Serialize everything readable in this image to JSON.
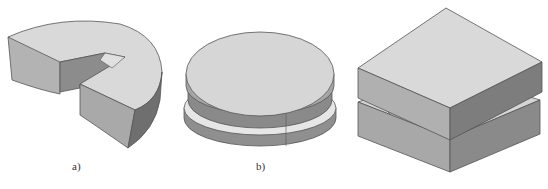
{
  "figures": [
    {
      "id": "a",
      "label": "a)",
      "description": "Three-quarter cylindrical block with a rectangular slot cut into it",
      "shape": "cut-cylinder-with-rectangular-slot"
    },
    {
      "id": "b",
      "label": "b)",
      "description": "Flat cylindrical disc with a circumferential groove",
      "shape": "grooved-disc"
    },
    {
      "id": "c",
      "label": "",
      "description": "Two rectangular plates stacked with a gap; lower plate has a semicircular channel",
      "shape": "stacked-plates-with-channel"
    }
  ],
  "colors": {
    "top_face": "#d9d9d9",
    "side_light": "#bdbdbd",
    "side_mid": "#a6a6a6",
    "side_dark": "#7a7a7a",
    "edge": "#555555",
    "groove_light": "#e6e6e6"
  }
}
